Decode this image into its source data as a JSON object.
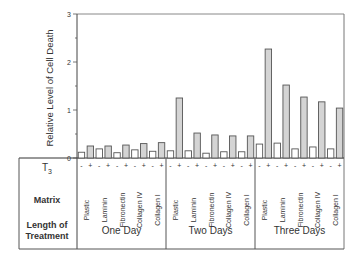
{
  "chart_data": {
    "type": "bar",
    "title": "",
    "xlabel": "",
    "ylabel": "Relative Level of Cell Death",
    "ylim": [
      0,
      3
    ],
    "yticks": [
      0,
      1,
      2,
      3
    ],
    "grid": false,
    "legend": null,
    "row_labels": {
      "t3": "T3",
      "matrix": "Matrix",
      "length": "Length of Treatment"
    },
    "groups": [
      {
        "name": "One Day",
        "matrices": [
          {
            "name": "Plastic",
            "minus": 0.12,
            "plus": 0.25
          },
          {
            "name": "Laminin",
            "minus": 0.19,
            "plus": 0.25
          },
          {
            "name": "Fibronectin",
            "minus": 0.11,
            "plus": 0.27
          },
          {
            "name": "Collagen IV",
            "minus": 0.17,
            "plus": 0.3
          },
          {
            "name": "Collagen I",
            "minus": 0.14,
            "plus": 0.32
          }
        ]
      },
      {
        "name": "Two Days",
        "matrices": [
          {
            "name": "Plastic",
            "minus": 0.15,
            "plus": 1.25
          },
          {
            "name": "Laminin",
            "minus": 0.15,
            "plus": 0.52
          },
          {
            "name": "Fibronectin",
            "minus": 0.1,
            "plus": 0.48
          },
          {
            "name": "Collagen IV",
            "minus": 0.13,
            "plus": 0.46
          },
          {
            "name": "Collagen I",
            "minus": 0.13,
            "plus": 0.46
          }
        ]
      },
      {
        "name": "Three Days",
        "matrices": [
          {
            "name": "Plastic",
            "minus": 0.29,
            "plus": 2.27
          },
          {
            "name": "Laminin",
            "minus": 0.31,
            "plus": 1.52
          },
          {
            "name": "Fibronectin",
            "minus": 0.19,
            "plus": 1.27
          },
          {
            "name": "Collagen IV",
            "minus": 0.23,
            "plus": 1.17
          },
          {
            "name": "Collagen I",
            "minus": 0.19,
            "plus": 1.04
          }
        ]
      }
    ],
    "t3_signs": [
      "-",
      "+"
    ],
    "colors": {
      "minus_fill": "#ffffff",
      "plus_fill": "#d4d4d4",
      "stroke": "#555555"
    }
  }
}
